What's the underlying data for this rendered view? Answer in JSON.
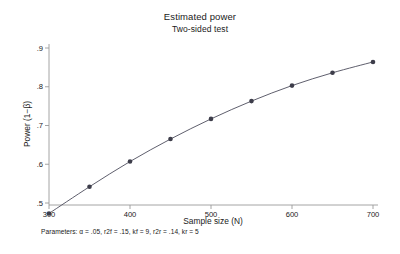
{
  "chart_data": {
    "type": "line",
    "title": "Estimated power",
    "subtitle": "Two-sided test",
    "xlabel": "Sample size (N)",
    "ylabel": "Power (1−β)",
    "note": "Parameters: α = .05, r2f = .15, kf = 9, r2r = .14, kr = 5",
    "x": [
      300,
      350,
      400,
      450,
      500,
      550,
      600,
      650,
      700
    ],
    "values": [
      0.473,
      0.542,
      0.607,
      0.665,
      0.717,
      0.763,
      0.803,
      0.836,
      0.864
    ],
    "series": [
      {
        "name": "Estimated power",
        "values": [
          0.473,
          0.542,
          0.607,
          0.665,
          0.717,
          0.763,
          0.803,
          0.836,
          0.864
        ]
      }
    ],
    "xlim": [
      300,
      700
    ],
    "ylim": [
      0.46,
      0.92
    ],
    "xticks": [
      300,
      400,
      500,
      600,
      700
    ],
    "xtick_labels": [
      "300",
      "400",
      "500",
      "600",
      "700"
    ],
    "yticks": [
      0.5,
      0.6,
      0.7,
      0.8,
      0.9
    ],
    "ytick_labels": [
      ".5",
      ".6",
      ".7",
      ".8",
      ".9"
    ],
    "grid": false,
    "legend": false,
    "legend_position": "none",
    "marker": "filled-circle",
    "line_color": "#4d4d5c",
    "marker_color": "#3d3d4a",
    "axis_color": "#9a9a9a",
    "background_color": "#ffffff"
  }
}
